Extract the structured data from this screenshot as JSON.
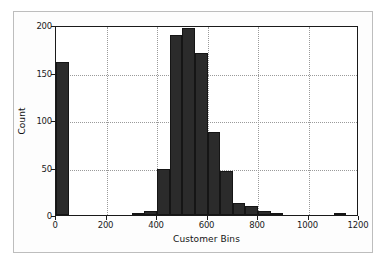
{
  "figure": {
    "background_color": "#ffffff",
    "frame_color": "#bdbdbd",
    "axis_color": "#1a1a1a",
    "bar_color": "#2b2b2b",
    "grid_color": "#9a9a9a"
  },
  "chart_data": {
    "type": "bar",
    "subtype": "histogram",
    "title": "",
    "xlabel": "Customer Bins",
    "ylabel": "Count",
    "xlim": [
      0,
      1200
    ],
    "ylim": [
      0,
      200
    ],
    "xticks": [
      0,
      200,
      400,
      600,
      800,
      1000,
      1200
    ],
    "xtick_labels": [
      "0",
      "200",
      "400",
      "600",
      "800",
      "1000",
      "1200"
    ],
    "yticks": [
      0,
      50,
      100,
      150,
      200
    ],
    "ytick_labels": [
      "0",
      "50",
      "100",
      "150",
      "200"
    ],
    "grid": true,
    "grid_style": "dotted",
    "legend": null,
    "bin_width": 50,
    "bins": [
      {
        "start": 0,
        "end": 50,
        "value": 161
      },
      {
        "start": 300,
        "end": 350,
        "value": 2
      },
      {
        "start": 350,
        "end": 400,
        "value": 4
      },
      {
        "start": 400,
        "end": 450,
        "value": 48
      },
      {
        "start": 450,
        "end": 500,
        "value": 189
      },
      {
        "start": 500,
        "end": 550,
        "value": 197
      },
      {
        "start": 550,
        "end": 600,
        "value": 171
      },
      {
        "start": 600,
        "end": 650,
        "value": 87
      },
      {
        "start": 650,
        "end": 700,
        "value": 46
      },
      {
        "start": 700,
        "end": 750,
        "value": 13
      },
      {
        "start": 750,
        "end": 800,
        "value": 10
      },
      {
        "start": 800,
        "end": 850,
        "value": 4
      },
      {
        "start": 850,
        "end": 900,
        "value": 1
      },
      {
        "start": 1100,
        "end": 1150,
        "value": 2
      }
    ],
    "categories": [
      "0-50",
      "300-350",
      "350-400",
      "400-450",
      "450-500",
      "500-550",
      "550-600",
      "600-650",
      "650-700",
      "700-750",
      "750-800",
      "800-850",
      "850-900",
      "1100-1150"
    ],
    "values": [
      161,
      2,
      4,
      48,
      189,
      197,
      171,
      87,
      46,
      13,
      10,
      4,
      1,
      2
    ]
  }
}
